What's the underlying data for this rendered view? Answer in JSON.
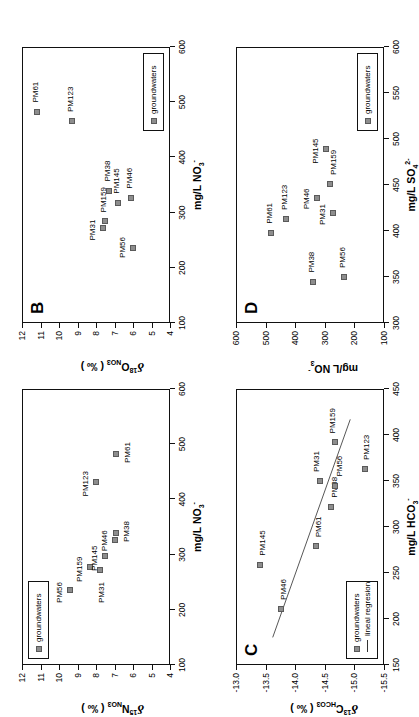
{
  "figure": {
    "orientation_deg": -90,
    "marker_color": "#8d8d8d",
    "marker_edge_color": "#5a5a5a",
    "axis_color": "#111111",
    "background": "#ffffff"
  },
  "panels": {
    "A": {
      "letter": "A",
      "legend": [
        {
          "type": "marker",
          "label": "groundwaters"
        }
      ]
    },
    "B": {
      "letter": "B",
      "legend": [
        {
          "type": "marker",
          "label": "groundwaters"
        }
      ]
    },
    "C": {
      "letter": "C",
      "legend": [
        {
          "type": "marker",
          "label": "groundwaters"
        },
        {
          "type": "line",
          "label": "lineal regresion"
        }
      ]
    },
    "D": {
      "letter": "D",
      "legend": [
        {
          "type": "marker",
          "label": "groundwaters"
        }
      ]
    }
  },
  "chart_data": [
    {
      "id": "A",
      "type": "scatter",
      "title": "A",
      "xlabel": "mg/L NO3-",
      "ylabel": "d15N NO3 ( permil )",
      "xlim": [
        100,
        600
      ],
      "ylim": [
        4,
        12
      ],
      "xticks": [
        100,
        200,
        300,
        400,
        500,
        600
      ],
      "yticks": [
        4,
        5,
        6,
        7,
        8,
        9,
        10,
        11,
        12
      ],
      "grid": false,
      "legend_position": "top-left",
      "points": [
        {
          "label": "PM56",
          "x": 235,
          "y": 9.4
        },
        {
          "label": "PM159",
          "x": 277,
          "y": 8.3
        },
        {
          "label": "PM31",
          "x": 272,
          "y": 7.8
        },
        {
          "label": "PM145",
          "x": 297,
          "y": 7.5
        },
        {
          "label": "PM46",
          "x": 327,
          "y": 7.0
        },
        {
          "label": "PM38",
          "x": 340,
          "y": 6.9
        },
        {
          "label": "PM123",
          "x": 432,
          "y": 8.0
        },
        {
          "label": "PM61",
          "x": 483,
          "y": 6.9
        }
      ]
    },
    {
      "id": "B",
      "type": "scatter",
      "title": "B",
      "xlabel": "mg/L NO3-",
      "ylabel": "d18O NO3 ( permil )",
      "xlim": [
        100,
        600
      ],
      "ylim": [
        4,
        12
      ],
      "xticks": [
        100,
        200,
        300,
        400,
        500,
        600
      ],
      "yticks": [
        4,
        5,
        6,
        7,
        8,
        9,
        10,
        11,
        12
      ],
      "grid": false,
      "legend_position": "bottom-right",
      "points": [
        {
          "label": "PM31",
          "x": 272,
          "y": 7.6
        },
        {
          "label": "PM159",
          "x": 284,
          "y": 7.5
        },
        {
          "label": "PM56",
          "x": 235,
          "y": 6.0
        },
        {
          "label": "PM145",
          "x": 318,
          "y": 6.8
        },
        {
          "label": "PM38",
          "x": 340,
          "y": 7.3
        },
        {
          "label": "PM46",
          "x": 327,
          "y": 6.1
        },
        {
          "label": "PM123",
          "x": 466,
          "y": 9.3
        },
        {
          "label": "PM61",
          "x": 483,
          "y": 11.2
        }
      ]
    },
    {
      "id": "C",
      "type": "scatter",
      "title": "C",
      "xlabel": "mg/L HCO3-",
      "ylabel": "d13C HCO3 ( permil )",
      "xlim": [
        150,
        450
      ],
      "ylim": [
        -15.5,
        -13.0
      ],
      "xticks": [
        150,
        200,
        250,
        300,
        350,
        400,
        450
      ],
      "yticks": [
        -15.5,
        -15.0,
        -14.5,
        -14.0,
        -13.5,
        -13.0
      ],
      "grid": false,
      "legend_position": "bottom-left",
      "points": [
        {
          "label": "PM46",
          "x": 211,
          "y": -13.76
        },
        {
          "label": "PM145",
          "x": 259,
          "y": -13.4
        },
        {
          "label": "PM61",
          "x": 279,
          "y": -14.35
        },
        {
          "label": "PM38",
          "x": 322,
          "y": -14.6
        },
        {
          "label": "PM31",
          "x": 350,
          "y": -14.42
        },
        {
          "label": "PM56",
          "x": 345,
          "y": -14.67
        },
        {
          "label": "PM159",
          "x": 392,
          "y": -14.68
        },
        {
          "label": "PM123",
          "x": 363,
          "y": -15.18
        }
      ],
      "regression": {
        "label": "lineal regresion",
        "x0": 180,
        "y0": -13.62,
        "x1": 417,
        "y1": -14.93
      }
    },
    {
      "id": "D",
      "type": "scatter",
      "title": "D",
      "xlabel": "mg/L SO4 2-",
      "ylabel": "mg/L NO3-",
      "xlim": [
        300,
        600
      ],
      "ylim": [
        100,
        600
      ],
      "xticks": [
        300,
        350,
        400,
        450,
        500,
        550,
        600
      ],
      "yticks": [
        100,
        200,
        300,
        400,
        500,
        600
      ],
      "grid": false,
      "legend_position": "bottom-right",
      "points": [
        {
          "label": "PM61",
          "x": 398,
          "y": 483
        },
        {
          "label": "PM123",
          "x": 413,
          "y": 432
        },
        {
          "label": "PM46",
          "x": 436,
          "y": 327
        },
        {
          "label": "PM31",
          "x": 420,
          "y": 272
        },
        {
          "label": "PM159",
          "x": 451,
          "y": 284
        },
        {
          "label": "PM145",
          "x": 489,
          "y": 297
        },
        {
          "label": "PM38",
          "x": 345,
          "y": 340
        },
        {
          "label": "PM56",
          "x": 350,
          "y": 235
        }
      ]
    }
  ],
  "labels": {
    "panelA": {
      "x_title_main": "mg/L NO",
      "x_title_sub": "3",
      "x_title_sup": "-",
      "y_delta": "δ",
      "y_sup": "15",
      "y_main": "N",
      "y_sub": "NO3",
      "y_unit": "( ‰ )"
    },
    "panelB": {
      "x_title_main": "mg/L NO",
      "x_title_sub": "3",
      "x_title_sup": "-",
      "y_delta": "δ",
      "y_sup": "18",
      "y_main": "O",
      "y_sub": "NO3",
      "y_unit": "( ‰ )"
    },
    "panelC": {
      "x_title_main": "mg/L HCO",
      "x_title_sub": "3",
      "x_title_sup": "-",
      "y_delta": "δ",
      "y_sup": "13",
      "y_main": "C",
      "y_sub": "HCO3",
      "y_unit": "( ‰ )"
    },
    "panelD": {
      "x_title_main": "mg/L SO",
      "x_title_sub": "4",
      "x_title_sup": "2-",
      "y_main": "mg/L NO",
      "y_sub": "3",
      "y_sup": "-"
    }
  }
}
